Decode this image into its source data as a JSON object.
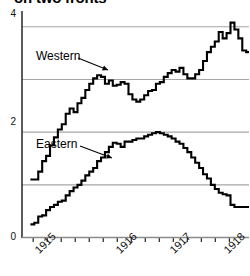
{
  "chart_data": {
    "type": "line",
    "title": "on two fronts",
    "title_clipped": true,
    "xlabel": "",
    "ylabel": "",
    "xlim": [
      1914.8,
      1918.85
    ],
    "ylim": [
      0,
      4.3
    ],
    "grid": true,
    "gridlines_y": [
      1,
      2,
      3,
      4
    ],
    "y_tick_labels": [
      "0",
      "2",
      "4"
    ],
    "y_tick_values": [
      0,
      2,
      4
    ],
    "x_tick_labels": [
      "1915",
      "1916",
      "1917",
      "1918"
    ],
    "x_tick_values": [
      1915,
      1916,
      1917,
      1918
    ],
    "x_minor_ticks": [
      1915.0,
      1915.25,
      1915.5,
      1915.75,
      1916.0,
      1916.25,
      1916.5,
      1916.75,
      1917.0,
      1917.25,
      1917.5,
      1917.75,
      1918.0,
      1918.25,
      1918.5
    ],
    "legend_position": "inline-annotations",
    "line_color": "#000000",
    "gridline_color": "#a6a6a6",
    "axis_color": "#333333",
    "series": [
      {
        "name": "Western",
        "label": "Western",
        "annotation_text": "Western",
        "x": [
          1914.95,
          1915.02,
          1915.09,
          1915.16,
          1915.23,
          1915.3,
          1915.37,
          1915.44,
          1915.51,
          1915.58,
          1915.65,
          1915.72,
          1915.79,
          1915.86,
          1915.93,
          1916.0,
          1916.07,
          1916.14,
          1916.21,
          1916.28,
          1916.35,
          1916.42,
          1916.49,
          1916.56,
          1916.63,
          1916.7,
          1916.77,
          1916.84,
          1916.91,
          1916.98,
          1917.05,
          1917.12,
          1917.19,
          1917.26,
          1917.33,
          1917.4,
          1917.47,
          1917.54,
          1917.61,
          1917.68,
          1917.75,
          1917.82,
          1917.89,
          1917.96,
          1918.03,
          1918.1,
          1918.17,
          1918.24,
          1918.31,
          1918.38,
          1918.45,
          1918.52,
          1918.59,
          1918.66,
          1918.73,
          1918.8
        ],
        "values": [
          1.1,
          1.1,
          1.25,
          1.45,
          1.55,
          1.75,
          1.9,
          2.05,
          2.15,
          2.35,
          2.45,
          2.38,
          2.55,
          2.65,
          2.8,
          2.92,
          3.02,
          3.08,
          3.05,
          2.92,
          2.98,
          2.88,
          2.9,
          2.95,
          2.92,
          2.72,
          2.62,
          2.58,
          2.62,
          2.7,
          2.78,
          2.8,
          2.92,
          2.95,
          3.05,
          3.12,
          3.18,
          3.15,
          3.22,
          3.1,
          3.02,
          3.02,
          3.1,
          3.18,
          3.35,
          3.52,
          3.62,
          3.72,
          3.9,
          3.78,
          3.88,
          4.08,
          3.95,
          3.78,
          3.55,
          3.52
        ],
        "annotation_at": {
          "x_px": 36,
          "y_px": 50
        }
      },
      {
        "name": "Eastern",
        "label": "Eastern",
        "annotation_text": "Eastern",
        "x": [
          1914.95,
          1915.02,
          1915.09,
          1915.16,
          1915.23,
          1915.3,
          1915.37,
          1915.44,
          1915.51,
          1915.58,
          1915.65,
          1915.72,
          1915.79,
          1915.86,
          1915.93,
          1916.0,
          1916.07,
          1916.14,
          1916.21,
          1916.28,
          1916.35,
          1916.42,
          1916.49,
          1916.56,
          1916.63,
          1916.7,
          1916.77,
          1916.84,
          1916.91,
          1916.98,
          1917.05,
          1917.12,
          1917.19,
          1917.26,
          1917.33,
          1917.4,
          1917.47,
          1917.54,
          1917.61,
          1917.68,
          1917.75,
          1917.82,
          1917.89,
          1917.96,
          1918.03,
          1918.1,
          1918.17,
          1918.24,
          1918.31,
          1918.38,
          1918.45,
          1918.52,
          1918.59,
          1918.66,
          1918.73,
          1918.8
        ],
        "values": [
          0.25,
          0.28,
          0.4,
          0.42,
          0.52,
          0.58,
          0.62,
          0.68,
          0.7,
          0.8,
          0.88,
          0.95,
          1.0,
          1.08,
          1.18,
          1.25,
          1.32,
          1.45,
          1.52,
          1.62,
          1.72,
          1.8,
          1.78,
          1.72,
          1.82,
          1.82,
          1.85,
          1.88,
          1.88,
          1.92,
          1.95,
          1.98,
          2.0,
          1.98,
          1.95,
          1.92,
          1.88,
          1.82,
          1.78,
          1.7,
          1.62,
          1.52,
          1.42,
          1.32,
          1.2,
          1.12,
          1.0,
          0.92,
          0.85,
          0.82,
          0.8,
          0.62,
          0.58,
          0.58,
          0.58,
          0.58
        ],
        "annotation_at": {
          "x_px": 36,
          "y_px": 138
        }
      }
    ],
    "annotations": [
      {
        "text": "Western",
        "arrow_from": [
          78,
          58
        ],
        "arrow_to": [
          108,
          70
        ]
      },
      {
        "text": "Eastern",
        "arrow_from": [
          80,
          146
        ],
        "arrow_to": [
          112,
          158
        ]
      }
    ]
  }
}
